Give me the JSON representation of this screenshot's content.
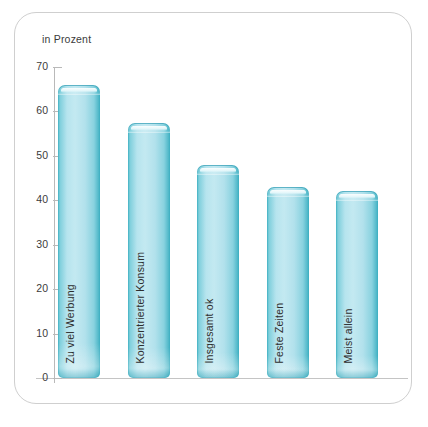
{
  "chart_data": {
    "type": "bar",
    "title": "",
    "subtitle": "",
    "unit_caption": "in Prozent",
    "xlabel": "",
    "ylabel": "in Prozent",
    "ylim": [
      0,
      70
    ],
    "grid": false,
    "legend": "none",
    "y_ticks": [
      0,
      10,
      20,
      30,
      40,
      50,
      60,
      70
    ],
    "y_tick_labels": [
      "0",
      "10",
      "20",
      "30",
      "40",
      "50",
      "60",
      "70"
    ],
    "categories": [
      "Zu viel Werbung",
      "Konzentrierter Konsum",
      "Insgesamt ok",
      "Feste Zeiten",
      "Meist allein"
    ],
    "values": [
      66,
      57.5,
      48,
      43,
      42
    ],
    "bar_color": "#a8dfeb",
    "bar_edge_color": "#3fb0c2",
    "axis_color": "#b9b9b9",
    "text_color": "#2e2e2e",
    "background": "#ffffff"
  },
  "frame": {
    "border_color": "#cfcfcf"
  },
  "bottom_caption": {
    "text": ""
  }
}
